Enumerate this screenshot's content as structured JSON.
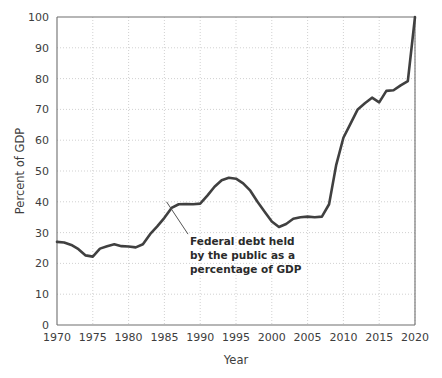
{
  "chart_data": {
    "type": "line",
    "title": "",
    "xlabel": "Year",
    "ylabel": "Percent of GDP",
    "xlim": [
      1970,
      2020
    ],
    "ylim": [
      0,
      100
    ],
    "grid": true,
    "legend": null,
    "line_color": "#404040",
    "grid_color": "#cccccc",
    "axis_color": "#6e6e6e",
    "background_color": "#ffffff",
    "xticks": [
      1970,
      1975,
      1980,
      1985,
      1990,
      1995,
      2000,
      2005,
      2010,
      2015,
      2020
    ],
    "xtick_labels": [
      "1970",
      "1975",
      "1980",
      "1985",
      "1990",
      "1995",
      "2000",
      "2005",
      "2010",
      "2015",
      "2020"
    ],
    "yticks": [
      0,
      10,
      20,
      30,
      40,
      50,
      60,
      70,
      80,
      90,
      100
    ],
    "ytick_labels": [
      "0",
      "10",
      "20",
      "30",
      "40",
      "50",
      "60",
      "70",
      "80",
      "90",
      "100"
    ],
    "series": [
      {
        "name": "Federal debt held by the public as a percentage of GDP",
        "x": [
          1970,
          1971,
          1972,
          1973,
          1974,
          1975,
          1976,
          1977,
          1978,
          1979,
          1980,
          1981,
          1982,
          1983,
          1984,
          1985,
          1986,
          1987,
          1988,
          1989,
          1990,
          1991,
          1992,
          1993,
          1994,
          1995,
          1996,
          1997,
          1998,
          1999,
          2000,
          2001,
          2002,
          2003,
          2004,
          2005,
          2006,
          2007,
          2008,
          2009,
          2010,
          2011,
          2012,
          2013,
          2014,
          2015,
          2016,
          2017,
          2018,
          2019,
          2020
        ],
        "values": [
          27.0,
          26.8,
          26.0,
          24.6,
          22.6,
          22.2,
          24.8,
          25.6,
          26.2,
          25.6,
          25.5,
          25.2,
          26.2,
          29.5,
          32.0,
          34.8,
          38.0,
          39.2,
          39.3,
          39.2,
          39.4,
          42.0,
          44.9,
          47.0,
          47.8,
          47.5,
          46.0,
          43.6,
          40.0,
          36.8,
          33.6,
          31.8,
          32.8,
          34.5,
          35.0,
          35.2,
          35.0,
          35.2,
          39.2,
          52.0,
          60.8,
          65.4,
          70.0,
          72.0,
          73.8,
          72.3,
          76.0,
          76.2,
          77.8,
          79.2,
          100.0
        ]
      }
    ],
    "annotation": {
      "lines": [
        "Federal debt held",
        "by the public as a",
        "percentage of GDP"
      ],
      "leader_from": [
        1985.3,
        40.0
      ],
      "leader_to": [
        1988.3,
        29.5
      ]
    }
  }
}
